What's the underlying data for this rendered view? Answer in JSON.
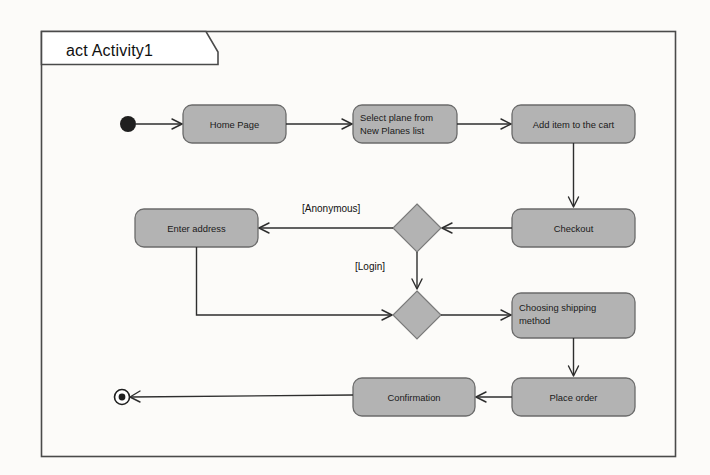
{
  "diagram": {
    "kind": "uml-activity-diagram",
    "frame_title": "act Activity1",
    "background_color": "#fcfbf9",
    "node_fill_color": "#b3b3b3",
    "node_stroke_color": "#6b6b6b",
    "line_color": "#2e2e2e",
    "nodes": [
      {
        "id": "initial",
        "type": "initial-node",
        "label": "",
        "cx": 128,
        "cy": 124
      },
      {
        "id": "home_page",
        "type": "action",
        "label": "Home Page",
        "label_lines": [
          "Home Page"
        ],
        "align": "center",
        "x": 183,
        "y": 105,
        "w": 103,
        "h": 38
      },
      {
        "id": "select_plane",
        "type": "action",
        "label": "Select plane from New Planes list",
        "label_lines": [
          "Select plane from",
          "New Planes list"
        ],
        "align": "left",
        "x": 353,
        "y": 105,
        "w": 104,
        "h": 38
      },
      {
        "id": "add_item",
        "type": "action",
        "label": "Add item to the cart",
        "label_lines": [
          "Add item to the cart"
        ],
        "align": "center",
        "x": 512,
        "y": 105,
        "w": 123,
        "h": 38
      },
      {
        "id": "checkout",
        "type": "action",
        "label": "Checkout",
        "label_lines": [
          "Checkout"
        ],
        "align": "center",
        "x": 512,
        "y": 209,
        "w": 123,
        "h": 38
      },
      {
        "id": "decision1",
        "type": "decision-node",
        "label": "",
        "cx": 417,
        "cy": 228,
        "rx": 24,
        "ry": 24
      },
      {
        "id": "enter_address",
        "type": "action",
        "label": "Enter address",
        "label_lines": [
          "Enter address"
        ],
        "align": "center",
        "x": 135,
        "y": 209,
        "w": 123,
        "h": 38
      },
      {
        "id": "merge1",
        "type": "merge-node",
        "label": "",
        "cx": 417,
        "cy": 315,
        "rx": 24,
        "ry": 24
      },
      {
        "id": "choosing_shipping",
        "type": "action",
        "label": "Choosing shipping method",
        "label_lines": [
          "Choosing shipping",
          "method"
        ],
        "align": "left",
        "x": 512,
        "y": 293,
        "w": 123,
        "h": 45
      },
      {
        "id": "place_order",
        "type": "action",
        "label": "Place order",
        "label_lines": [
          "Place order"
        ],
        "align": "center",
        "x": 512,
        "y": 378,
        "w": 123,
        "h": 38
      },
      {
        "id": "confirmation",
        "type": "action",
        "label": "Confirmation",
        "label_lines": [
          "Confirmation"
        ],
        "align": "center",
        "x": 353,
        "y": 378,
        "w": 122,
        "h": 38
      },
      {
        "id": "final",
        "type": "final-node",
        "label": "",
        "cx": 122,
        "cy": 397
      }
    ],
    "guards": [
      {
        "id": "guard_anonymous",
        "label": "[Anonymous]",
        "x": 302,
        "y": 212
      },
      {
        "id": "guard_login",
        "label": "[Login]",
        "x": 355,
        "y": 270
      }
    ],
    "edges": [
      {
        "id": "edge-initial-home",
        "from": "initial",
        "to": "home_page",
        "guard": ""
      },
      {
        "id": "edge-home-select",
        "from": "home_page",
        "to": "select_plane",
        "guard": ""
      },
      {
        "id": "edge-select-add",
        "from": "select_plane",
        "to": "add_item",
        "guard": ""
      },
      {
        "id": "edge-add-checkout",
        "from": "add_item",
        "to": "checkout",
        "guard": ""
      },
      {
        "id": "edge-checkout-decision",
        "from": "checkout",
        "to": "decision1",
        "guard": ""
      },
      {
        "id": "edge-decision-address",
        "from": "decision1",
        "to": "enter_address",
        "guard": "[Anonymous]"
      },
      {
        "id": "edge-decision-merge",
        "from": "decision1",
        "to": "merge1",
        "guard": "[Login]"
      },
      {
        "id": "edge-address-merge",
        "from": "enter_address",
        "to": "merge1",
        "guard": ""
      },
      {
        "id": "edge-merge-shipping",
        "from": "merge1",
        "to": "choosing_shipping",
        "guard": ""
      },
      {
        "id": "edge-shipping-place",
        "from": "choosing_shipping",
        "to": "place_order",
        "guard": ""
      },
      {
        "id": "edge-place-confirmation",
        "from": "place_order",
        "to": "confirmation",
        "guard": ""
      },
      {
        "id": "edge-confirmation-final",
        "from": "confirmation",
        "to": "final",
        "guard": ""
      }
    ]
  }
}
